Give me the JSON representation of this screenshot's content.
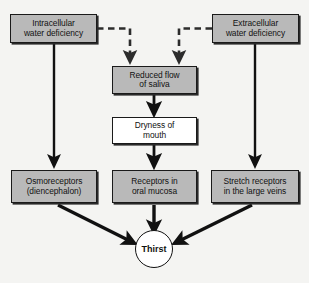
{
  "diagram": {
    "background_color": "#f4f4f2",
    "box_fill_color": "#b9b9b9",
    "box_white_color": "#ffffff",
    "line_color": "#111111",
    "nodes": [
      {
        "id": "intracellular",
        "label": "Intracellular\nwater deficiency",
        "fill": "gray",
        "x": 10,
        "y": 14,
        "w": 87,
        "h": 29
      },
      {
        "id": "extracellular",
        "label": "Extracellular\nwater deficiency",
        "fill": "gray",
        "x": 212,
        "y": 14,
        "w": 87,
        "h": 29
      },
      {
        "id": "reduced-saliva",
        "label": "Reduced flow\nof saliva",
        "fill": "gray",
        "x": 112,
        "y": 66,
        "w": 85,
        "h": 28
      },
      {
        "id": "dryness-mouth",
        "label": "Dryness of\nmouth",
        "fill": "white",
        "x": 112,
        "y": 117,
        "w": 85,
        "h": 27
      },
      {
        "id": "osmoreceptors",
        "label": "Osmoreceptors\n(diencephalon)",
        "fill": "gray",
        "x": 11,
        "y": 170,
        "w": 86,
        "h": 33
      },
      {
        "id": "oral-mucosa",
        "label": "Receptors in\noral mucosa",
        "fill": "gray",
        "x": 112,
        "y": 170,
        "w": 85,
        "h": 33
      },
      {
        "id": "stretch-receptors",
        "label": "Stretch receptors\nin the large veins",
        "fill": "gray",
        "x": 211,
        "y": 170,
        "w": 88,
        "h": 33
      }
    ],
    "thirst": {
      "id": "thirst",
      "label": "Thirst",
      "cx": 154,
      "cy": 249,
      "r": 19
    },
    "edges": [
      {
        "from": "intracellular",
        "to": "reduced-saliva",
        "style": "dashed"
      },
      {
        "from": "extracellular",
        "to": "reduced-saliva",
        "style": "dashed"
      },
      {
        "from": "intracellular",
        "to": "osmoreceptors",
        "style": "solid"
      },
      {
        "from": "extracellular",
        "to": "stretch-receptors",
        "style": "solid"
      },
      {
        "from": "reduced-saliva",
        "to": "dryness-mouth",
        "style": "solid"
      },
      {
        "from": "dryness-mouth",
        "to": "oral-mucosa",
        "style": "solid"
      },
      {
        "from": "osmoreceptors",
        "to": "thirst",
        "style": "solid"
      },
      {
        "from": "oral-mucosa",
        "to": "thirst",
        "style": "solid"
      },
      {
        "from": "stretch-receptors",
        "to": "thirst",
        "style": "solid"
      }
    ]
  }
}
